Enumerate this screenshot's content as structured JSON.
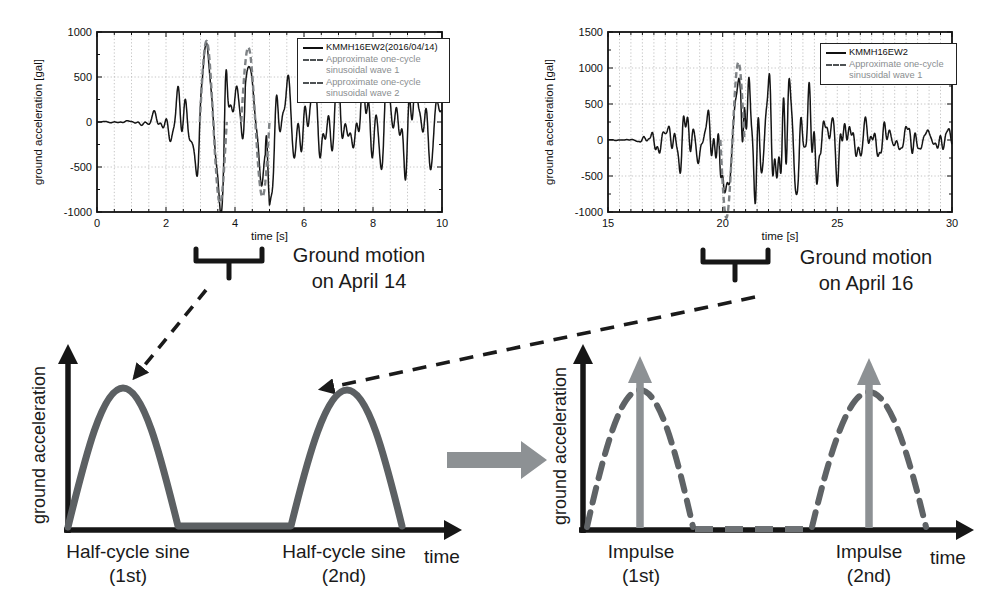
{
  "figure": {
    "annotations": {
      "ground_motion_april14": "Ground motion\non April 14",
      "ground_motion_april16": "Ground motion\non April 16",
      "schematic_left_ylabel": "ground acceleration",
      "schematic_right_ylabel": "ground acceleration",
      "half_cycle_1": "Half-cycle sine\n(1st)",
      "half_cycle_2": "Half-cycle sine\n(2nd)",
      "impulse_1": "Impulse\n(1st)",
      "impulse_2": "Impulse\n(2nd)",
      "time_left": "time",
      "time_right": "time"
    },
    "colors": {
      "waveform": "#151515",
      "approx_wave": "#7e8285",
      "schematic_pulse": "#5c6063",
      "impulse_arrow": "#8d9194",
      "transform_arrow": "#8d9194",
      "axis_black": "#161616",
      "grid": "#b8b8b8",
      "legend_gray_text": "#8a8e90"
    }
  },
  "chart_data": [
    {
      "type": "line",
      "title": "",
      "xlabel": "time [s]",
      "ylabel": "ground acceleration [gal]",
      "xlim": [
        0,
        10
      ],
      "ylim": [
        -1000,
        1000
      ],
      "xticks": [
        0,
        2,
        4,
        6,
        8,
        10
      ],
      "yticks": [
        1000,
        500,
        0,
        -500,
        -1000
      ],
      "grid": true,
      "legend_position": "top-right",
      "series": [
        {
          "name": "KMMH16EW2(2016/04/14)",
          "style": "solid",
          "color": "#151515",
          "peak_gal": 930,
          "peak_time_s": 3.3,
          "waveform": {
            "seed": 7,
            "dominant_period_s": 0.42,
            "envelope": [
              [
                0,
                3
              ],
              [
                0.9,
                10
              ],
              [
                1.5,
                55
              ],
              [
                2.0,
                130
              ],
              [
                2.5,
                300
              ],
              [
                2.9,
                650
              ],
              [
                3.25,
                930
              ],
              [
                3.6,
                880
              ],
              [
                3.95,
                500
              ],
              [
                4.3,
                680
              ],
              [
                4.6,
                800
              ],
              [
                4.95,
                830
              ],
              [
                5.3,
                470
              ],
              [
                5.8,
                360
              ],
              [
                6.3,
                320
              ],
              [
                6.9,
                390
              ],
              [
                7.5,
                350
              ],
              [
                8.1,
                430
              ],
              [
                8.7,
                390
              ],
              [
                9.3,
                480
              ],
              [
                9.7,
                340
              ],
              [
                10,
                260
              ]
            ]
          }
        },
        {
          "name": "Approximate one-cycle sinusoidal wave 1",
          "style": "dashed",
          "color": "#7e8285",
          "one_cycle_sine": {
            "t_start_s": 2.98,
            "period_s": 0.78,
            "amplitude_gal": 900,
            "sign": 1
          }
        },
        {
          "name": "Approximate one-cycle sinusoidal wave 2",
          "style": "dashed",
          "color": "#7e8285",
          "one_cycle_sine": {
            "t_start_s": 4.18,
            "period_s": 0.82,
            "amplitude_gal": 830,
            "sign": 1
          }
        }
      ]
    },
    {
      "type": "line",
      "title": "",
      "xlabel": "time [s]",
      "ylabel": "ground acceleration [gal]",
      "xlim": [
        15,
        30
      ],
      "ylim": [
        -1000,
        1500
      ],
      "xticks": [
        15,
        20,
        25,
        30
      ],
      "yticks": [
        1500,
        1000,
        500,
        0,
        -500,
        -1000
      ],
      "grid": true,
      "legend_position": "top-right",
      "series": [
        {
          "name": "KMMH16EW2",
          "style": "solid",
          "color": "#151515",
          "peak_gal": 1150,
          "peak_time_s": 20.6,
          "waveform": {
            "seed": 23,
            "dominant_period_s": 0.5,
            "envelope": [
              [
                15,
                3
              ],
              [
                16,
                8
              ],
              [
                16.6,
                35
              ],
              [
                17.1,
                140
              ],
              [
                17.6,
                230
              ],
              [
                18.1,
                290
              ],
              [
                18.6,
                330
              ],
              [
                19.1,
                270
              ],
              [
                19.6,
                330
              ],
              [
                19.95,
                500
              ],
              [
                20.2,
                960
              ],
              [
                20.6,
                1150
              ],
              [
                21.0,
                720
              ],
              [
                21.4,
                600
              ],
              [
                21.9,
                690
              ],
              [
                22.4,
                740
              ],
              [
                22.9,
                690
              ],
              [
                23.4,
                610
              ],
              [
                23.9,
                510
              ],
              [
                24.6,
                400
              ],
              [
                25.3,
                290
              ],
              [
                26.1,
                220
              ],
              [
                27,
                185
              ],
              [
                28,
                160
              ],
              [
                29,
                135
              ],
              [
                30,
                105
              ]
            ]
          }
        },
        {
          "name": "Approximate one-cycle sinusoidal wave 1",
          "style": "dashed",
          "color": "#7e8285",
          "one_cycle_sine": {
            "t_start_s": 19.9,
            "period_s": 1.05,
            "amplitude_gal": 1080,
            "sign": -1
          }
        }
      ]
    }
  ]
}
